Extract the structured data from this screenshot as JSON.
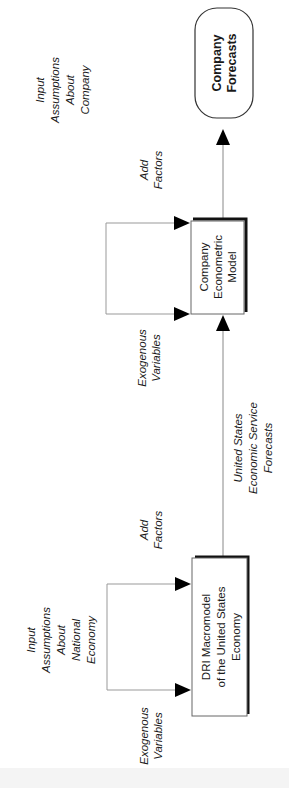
{
  "diagram": {
    "orientation": "rotated-90-ccw",
    "nodes": {
      "company_forecasts": {
        "lines": [
          "Company",
          "Forecasts"
        ],
        "shape": "rounded-rectangle"
      },
      "company_model": {
        "lines": [
          "Company",
          "Econometric",
          "Model"
        ],
        "shape": "rectangle-with-shadow"
      },
      "dri_model": {
        "lines": [
          "DRI Macromodel",
          "of the United States",
          "Economy"
        ],
        "shape": "rectangle-with-shadow"
      }
    },
    "labels": {
      "company_add_factors": [
        "Add",
        "Factors"
      ],
      "company_input_assumptions": [
        "Input",
        "Assumptions",
        "About",
        "Company"
      ],
      "company_exogenous": [
        "Exogenous",
        "Variables"
      ],
      "us_service_forecasts": [
        "United States",
        "Economic Service",
        "Forecasts"
      ],
      "dri_add_factors": [
        "Add",
        "Factors"
      ],
      "dri_input_assumptions": [
        "Input",
        "Assumptions",
        "About",
        "National",
        "Economy"
      ],
      "dri_exogenous": [
        "Exogenous",
        "Variables"
      ]
    },
    "edges": [
      {
        "from": "dri_model",
        "to": "company_model",
        "label": "United States Economic Service Forecasts"
      },
      {
        "from": "company_model",
        "to": "company_forecasts"
      },
      {
        "from": "input_assumptions_national_economy",
        "to": "dri_model",
        "labels": [
          "Add Factors",
          "Exogenous Variables"
        ]
      },
      {
        "from": "input_assumptions_company",
        "to": "company_model",
        "labels": [
          "Add Factors",
          "Exogenous Variables"
        ]
      }
    ],
    "colors": {
      "line": "#7a7a7a",
      "box_border": "#555555",
      "shadow": "#111111",
      "text": "#1a1a1a",
      "background": "#ffffff"
    }
  }
}
